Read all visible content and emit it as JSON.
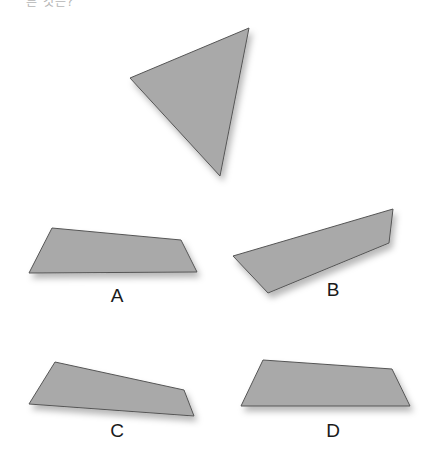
{
  "question_fragment": "른 것은?",
  "fill_color": "#a9a9a9",
  "edge_color": "#555555",
  "reference_shape": {
    "name": "triangle",
    "kind": "triangle"
  },
  "options": [
    {
      "label": "A",
      "kind": "quadrilateral"
    },
    {
      "label": "B",
      "kind": "quadrilateral"
    },
    {
      "label": "C",
      "kind": "quadrilateral"
    },
    {
      "label": "D",
      "kind": "quadrilateral"
    }
  ]
}
